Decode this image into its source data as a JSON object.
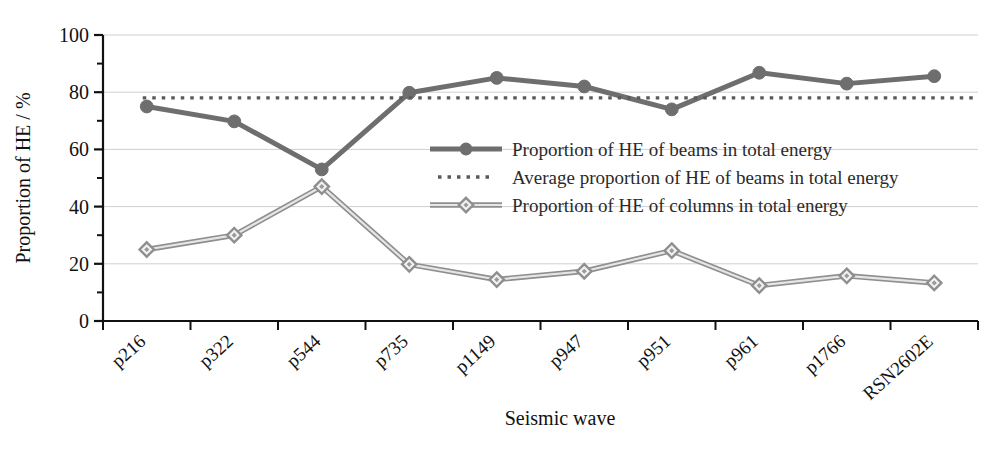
{
  "chart_data": {
    "type": "line",
    "title": "",
    "xlabel": "Seismic wave",
    "ylabel": "Proportion of HE / %",
    "categories": [
      "p216",
      "p322",
      "p544",
      "p735",
      "p1149",
      "p947",
      "p951",
      "p961",
      "p1766",
      "RSN2602E"
    ],
    "ylim": [
      0,
      100
    ],
    "yticks": [
      0,
      20,
      40,
      60,
      80,
      100
    ],
    "ytick_labels": [
      "0",
      "20",
      "40",
      "60",
      "80",
      "100"
    ],
    "yminor_step": 10,
    "grid": "horizontal-major",
    "legend_position": "center",
    "series": [
      {
        "name": "Proportion of HE of beams in total energy",
        "key": "beams",
        "marker": "filled-circle",
        "style": "solid",
        "color": "#6e6e6e",
        "values": [
          75.0,
          69.8,
          53.0,
          79.8,
          85.0,
          82.0,
          74.0,
          86.8,
          83.0,
          85.6
        ]
      },
      {
        "name": "Average proportion  of HE of beams in total energy",
        "key": "average",
        "marker": "none",
        "style": "dotted",
        "color": "#5a5a5a",
        "value": 78.0
      },
      {
        "name": "Proportion of HE of columns in total energy",
        "key": "columns",
        "marker": "hollow-diamond",
        "style": "solid",
        "color": "#9b9b9b",
        "values": [
          25.0,
          30.0,
          47.0,
          19.8,
          14.5,
          17.4,
          24.6,
          12.4,
          15.8,
          13.3
        ]
      }
    ]
  },
  "legend": {
    "entries": [
      "Proportion of HE of beams in total energy",
      "Average proportion  of HE of beams in total energy",
      "Proportion of HE of columns in total energy"
    ]
  }
}
